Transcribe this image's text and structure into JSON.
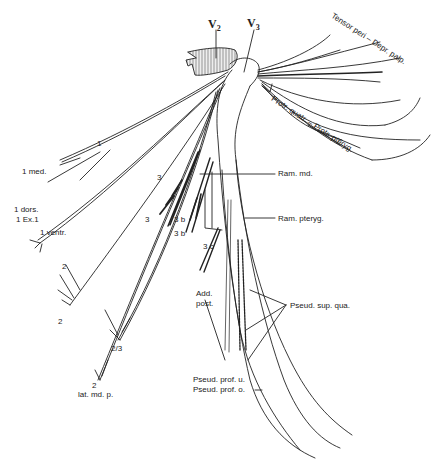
{
  "figure": {
    "type": "anatomical nerve branching diagram",
    "labels": {
      "v2": "V",
      "v2_sub": "2",
      "v3": "V",
      "v3_sub": "3",
      "tensor": "Tensor peri – Depr. palp.",
      "protr": "Protr. quatr. – Protr. pteryg.",
      "ram_md": "Ram. md.",
      "ram_pteryg": "Ram. pteryg.",
      "one_top": "1",
      "one_med": "1 med.",
      "one_dors": "1 dors.",
      "one_ex": "1 Ex.1",
      "one_ventr": "1 ventr.",
      "two_a": "2",
      "two_b": "2",
      "two_three": "2/3",
      "two_c": "2",
      "lat_md_p": "lat. md. p.",
      "three_a": "3",
      "three_b": "3",
      "three_b1": "3 b",
      "three_b2": "3 b",
      "three_c": "3 c",
      "add_post_1": "Add.",
      "add_post_2": "post.",
      "pseud_sup_qua": "Pseud. sup. qua.",
      "pseud_prof_u": "Pseud. prof. u.",
      "pseud_prof_o": "Pseud. prof. o."
    },
    "colors": {
      "ink": "#222222",
      "hatch_fill": "#e8e8e8",
      "background": "#ffffff"
    }
  }
}
